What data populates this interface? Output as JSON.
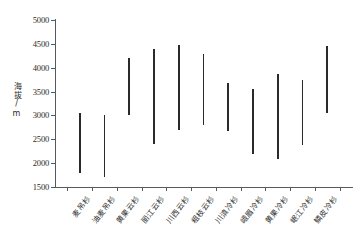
{
  "chart_data": {
    "type": "bar",
    "subtype": "floating-range-bar",
    "title": "",
    "xlabel": "",
    "ylabel": "海拔/m",
    "ylim": [
      1500,
      5000
    ],
    "yticks": [
      1500,
      2000,
      2500,
      3000,
      3500,
      4000,
      4500,
      5000
    ],
    "ytick_labels": [
      "1500",
      "2000",
      "2500",
      "3000",
      "3500",
      "4000",
      "4500",
      "5000"
    ],
    "grid": false,
    "legend": false,
    "bar_color": "#2a2a2a",
    "axis_color": "#555a5e",
    "categories": [
      "麦吊杉",
      "油麦吊杉",
      "黄果云杉",
      "丽江云杉",
      "川西云杉",
      "粗枝云杉",
      "川滇冷杉",
      "峨眉冷杉",
      "黄果冷杉",
      "岷江冷杉",
      "鳞皮冷杉"
    ],
    "series": [
      {
        "name": "海拔范围下限",
        "values": [
          1800,
          1700,
          3000,
          2400,
          2690,
          2800,
          2680,
          2200,
          2080,
          2390,
          3060
        ]
      },
      {
        "name": "海拔范围上限",
        "values": [
          3050,
          3000,
          4200,
          4400,
          4480,
          4280,
          3670,
          3560,
          3860,
          3750,
          4450
        ]
      }
    ],
    "ranges": [
      {
        "category": "麦吊杉",
        "min": 1800,
        "max": 3050
      },
      {
        "category": "油麦吊杉",
        "min": 1700,
        "max": 3000
      },
      {
        "category": "黄果云杉",
        "min": 3000,
        "max": 4200
      },
      {
        "category": "丽江云杉",
        "min": 2400,
        "max": 4400
      },
      {
        "category": "川西云杉",
        "min": 2690,
        "max": 4480
      },
      {
        "category": "粗枝云杉",
        "min": 2800,
        "max": 4280
      },
      {
        "category": "川滇冷杉",
        "min": 2680,
        "max": 3670
      },
      {
        "category": "峨眉冷杉",
        "min": 2200,
        "max": 3560
      },
      {
        "category": "黄果冷杉",
        "min": 2080,
        "max": 3860
      },
      {
        "category": "岷江冷杉",
        "min": 2390,
        "max": 3750
      },
      {
        "category": "鳞皮冷杉",
        "min": 3060,
        "max": 4450
      }
    ]
  }
}
